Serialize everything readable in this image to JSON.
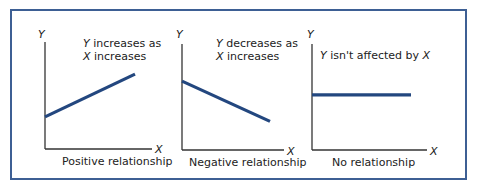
{
  "colors": {
    "frame": "#3d5f94",
    "line": "#23477f",
    "axis": "#333333"
  },
  "chart_data": [
    {
      "type": "line",
      "name": "positive",
      "xlabel": "X",
      "ylabel": "Y",
      "annotation": [
        "Y increases as",
        "X increases"
      ],
      "caption": "Positive relationship",
      "points": [
        [
          0,
          0.3
        ],
        [
          1,
          0.7
        ]
      ],
      "xlim": [
        0,
        1.2
      ],
      "ylim": [
        0,
        1.0
      ],
      "grid": false
    },
    {
      "type": "line",
      "name": "negative",
      "xlabel": "X",
      "ylabel": "Y",
      "annotation": [
        "Y decreases as",
        "X increases"
      ],
      "caption": "Negative relationship",
      "points": [
        [
          0,
          0.65
        ],
        [
          1,
          0.27
        ]
      ],
      "xlim": [
        0,
        1.2
      ],
      "ylim": [
        0,
        1.0
      ],
      "grid": false
    },
    {
      "type": "line",
      "name": "none",
      "xlabel": "X",
      "ylabel": "Y",
      "annotation": [
        "Y isn't affected by X"
      ],
      "caption": "No relationship",
      "points": [
        [
          0,
          0.52
        ],
        [
          1,
          0.52
        ]
      ],
      "xlim": [
        0,
        1.2
      ],
      "ylim": [
        0,
        1.0
      ],
      "grid": false
    }
  ]
}
